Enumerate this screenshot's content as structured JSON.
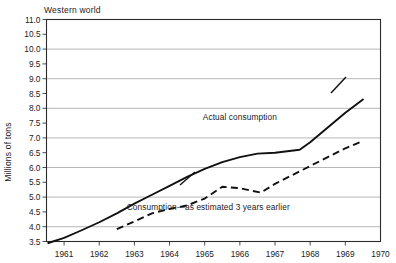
{
  "chart_data": {
    "type": "line",
    "title": "Western world",
    "xlabel": "",
    "ylabel": "Millions of tons",
    "xlim": [
      1960.5,
      1970.0
    ],
    "ylim": [
      3.5,
      11.0
    ],
    "grid": "horizontal-integers-only",
    "legend": "inline-annotations",
    "x_ticks": [
      1961,
      1962,
      1963,
      1964,
      1965,
      1966,
      1967,
      1968,
      1969,
      1970
    ],
    "x_tick_labels": [
      "1961",
      "1962",
      "1963",
      "1964",
      "1965",
      "1966",
      "1967",
      "1968",
      "1969",
      "1970"
    ],
    "y_ticks": [
      3.5,
      4.0,
      4.5,
      5.0,
      5.5,
      6.0,
      6.5,
      7.0,
      7.5,
      8.0,
      8.5,
      9.0,
      9.5,
      10.0,
      10.5,
      11.0
    ],
    "y_tick_labels": [
      "3.5",
      "4.0",
      "4.5",
      "5.0",
      "5.5",
      "6.0",
      "6.5",
      "7.0",
      "7.5",
      "8.0",
      "8.5",
      "9.0",
      "9.5",
      "10.0",
      "10.5",
      "11.0"
    ],
    "gridline_values": [
      4.0,
      5.0,
      6.0,
      7.0,
      8.0,
      9.0,
      10.0,
      11.0
    ],
    "series": [
      {
        "name": "Actual consumption",
        "style": "solid",
        "color": "#111111",
        "x": [
          1960.55,
          1961.0,
          1961.5,
          1962.0,
          1962.5,
          1963.0,
          1963.5,
          1964.0,
          1964.5,
          1965.0,
          1965.5,
          1966.0,
          1966.5,
          1967.0,
          1967.7,
          1968.0,
          1968.5,
          1969.0,
          1969.5
        ],
        "y": [
          3.45,
          3.62,
          3.88,
          4.15,
          4.45,
          4.78,
          5.08,
          5.38,
          5.68,
          5.95,
          6.18,
          6.35,
          6.47,
          6.5,
          6.6,
          6.85,
          7.35,
          7.85,
          8.3
        ]
      },
      {
        "name": "Consumption—as estimated 3 years earlier",
        "style": "dashed",
        "color": "#111111",
        "x": [
          1962.5,
          1963.0,
          1963.5,
          1964.0,
          1964.5,
          1965.0,
          1965.5,
          1966.0,
          1966.6,
          1967.0,
          1967.5,
          1968.0,
          1968.5,
          1969.0,
          1969.5
        ],
        "y": [
          3.92,
          4.18,
          4.45,
          4.6,
          4.72,
          4.95,
          5.35,
          5.3,
          5.15,
          5.45,
          5.75,
          6.05,
          6.35,
          6.65,
          6.9
        ]
      }
    ],
    "annotations": [
      {
        "text": "Actual consumption",
        "x": 1966.0,
        "y": 7.6
      },
      {
        "text": "Consumption—as estimated 3 years earlier",
        "x": 1965.1,
        "y": 4.55
      }
    ]
  }
}
